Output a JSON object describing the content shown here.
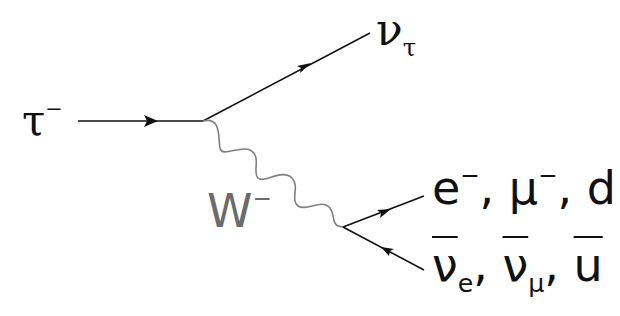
{
  "diagram": {
    "particles": {
      "incoming": {
        "symbol": "τ",
        "charge": "−"
      },
      "neutrino_out": {
        "symbol": "ν",
        "subscript": "τ"
      },
      "boson": {
        "symbol": "W",
        "charge": "−"
      },
      "fermions_out": [
        {
          "symbol": "e",
          "charge": "−"
        },
        {
          "symbol": "μ",
          "charge": "−"
        },
        {
          "symbol": "d",
          "charge": ""
        }
      ],
      "antifermions_out": [
        {
          "symbol": "ν",
          "subscript": "e"
        },
        {
          "symbol": "ν",
          "subscript": "μ"
        },
        {
          "symbol": "u",
          "subscript": ""
        }
      ],
      "separator": ","
    },
    "colors": {
      "fermion_line": "#111111",
      "boson_line": "#808080",
      "boson_label": "#6b6b6b",
      "text": "#111111"
    }
  }
}
